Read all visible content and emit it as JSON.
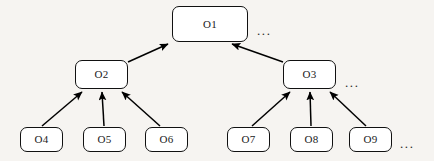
{
  "diagram": {
    "type": "hierarchy-tree",
    "title": "",
    "background_color": "#f6f4f1",
    "node_fill_color": "#ffffff",
    "node_border_color": "#111111",
    "edge_color": "#000000",
    "nodes": [
      {
        "id": "o1",
        "label": "O1",
        "level": 0,
        "x": 172,
        "y": 6,
        "w": 76,
        "h": 36
      },
      {
        "id": "o2",
        "label": "O2",
        "level": 1,
        "x": 75,
        "y": 60,
        "w": 53,
        "h": 29
      },
      {
        "id": "o3",
        "label": "O3",
        "level": 1,
        "x": 283,
        "y": 60,
        "w": 53,
        "h": 29
      },
      {
        "id": "o4",
        "label": "O4",
        "level": 2,
        "x": 20,
        "y": 127,
        "w": 43,
        "h": 25
      },
      {
        "id": "o5",
        "label": "O5",
        "level": 2,
        "x": 83,
        "y": 127,
        "w": 43,
        "h": 25
      },
      {
        "id": "o6",
        "label": "O6",
        "level": 2,
        "x": 145,
        "y": 127,
        "w": 43,
        "h": 25
      },
      {
        "id": "o7",
        "label": "O7",
        "level": 2,
        "x": 227,
        "y": 127,
        "w": 43,
        "h": 25
      },
      {
        "id": "o8",
        "label": "O8",
        "level": 2,
        "x": 290,
        "y": 127,
        "w": 43,
        "h": 25
      },
      {
        "id": "o9",
        "label": "O9",
        "level": 2,
        "x": 349,
        "y": 127,
        "w": 43,
        "h": 25
      }
    ],
    "edges": [
      {
        "from": "o2",
        "to": "o1",
        "x1": 128,
        "y1": 62,
        "x2": 168,
        "y2": 44
      },
      {
        "from": "o3",
        "to": "o1",
        "x1": 283,
        "y1": 62,
        "x2": 232,
        "y2": 44
      },
      {
        "from": "o4",
        "to": "o2",
        "x1": 42,
        "y1": 126,
        "x2": 82,
        "y2": 92
      },
      {
        "from": "o5",
        "to": "o2",
        "x1": 104,
        "y1": 126,
        "x2": 102,
        "y2": 92
      },
      {
        "from": "o6",
        "to": "o2",
        "x1": 160,
        "y1": 126,
        "x2": 122,
        "y2": 92
      },
      {
        "from": "o7",
        "to": "o3",
        "x1": 252,
        "y1": 126,
        "x2": 290,
        "y2": 92
      },
      {
        "from": "o8",
        "to": "o3",
        "x1": 311,
        "y1": 126,
        "x2": 310,
        "y2": 92
      },
      {
        "from": "o9",
        "to": "o3",
        "x1": 366,
        "y1": 126,
        "x2": 330,
        "y2": 92
      }
    ],
    "ellipses": [
      {
        "id": "ellipsis-top",
        "text": "...",
        "x": 257,
        "y": 24
      },
      {
        "id": "ellipsis-middle-right",
        "text": "...",
        "x": 345,
        "y": 76
      },
      {
        "id": "ellipsis-bottom-right",
        "text": "...",
        "x": 400,
        "y": 137
      }
    ]
  }
}
